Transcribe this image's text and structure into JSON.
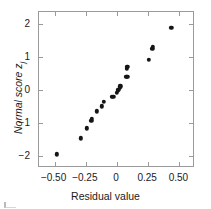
{
  "figure": {
    "background_color": "#ffffff",
    "frame_color": "#9a9a9a",
    "marker_color": "#151515"
  },
  "chart_data": {
    "type": "scatter",
    "title": "",
    "xlabel": "Residual value",
    "ylabel": "Normal score z",
    "ylabel_subscript": "j",
    "xlim": [
      -0.625,
      0.625
    ],
    "ylim": [
      -2.35,
      2.35
    ],
    "xticks": [
      -0.5,
      -0.25,
      0,
      0.25,
      0.5
    ],
    "xtick_labels": [
      "−0.50",
      "−0.25",
      "0",
      "0.25",
      "0.50"
    ],
    "yticks": [
      -2,
      -1,
      0,
      1,
      2
    ],
    "ytick_labels": [
      "−2",
      "−1",
      "0",
      "1",
      "2"
    ],
    "grid": false,
    "legend": false,
    "marker": "filled-circle",
    "n_points": 22,
    "points": [
      {
        "x": -0.472,
        "y": -1.97
      },
      {
        "x": -0.283,
        "y": -1.49
      },
      {
        "x": -0.232,
        "y": -1.19
      },
      {
        "x": -0.197,
        "y": -0.96
      },
      {
        "x": -0.193,
        "y": -0.9
      },
      {
        "x": -0.152,
        "y": -0.67
      },
      {
        "x": -0.113,
        "y": -0.52
      },
      {
        "x": -0.098,
        "y": -0.38
      },
      {
        "x": -0.035,
        "y": -0.24
      },
      {
        "x": -0.022,
        "y": -0.23
      },
      {
        "x": 0.006,
        "y": -0.11
      },
      {
        "x": 0.014,
        "y": -0.06
      },
      {
        "x": 0.02,
        "y": -0.02
      },
      {
        "x": 0.03,
        "y": 0.04
      },
      {
        "x": 0.036,
        "y": 0.08
      },
      {
        "x": 0.082,
        "y": 0.37
      },
      {
        "x": 0.092,
        "y": 0.37
      },
      {
        "x": 0.088,
        "y": 0.6
      },
      {
        "x": 0.09,
        "y": 0.66
      },
      {
        "x": 0.262,
        "y": 0.88
      },
      {
        "x": 0.292,
        "y": 1.21
      },
      {
        "x": 0.293,
        "y": 1.27
      },
      {
        "x": 0.443,
        "y": 1.84
      }
    ]
  }
}
